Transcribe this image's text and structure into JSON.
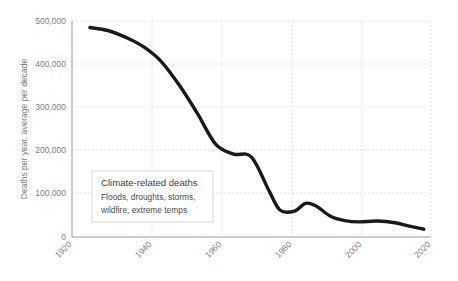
{
  "chart_data": {
    "type": "line",
    "title": "",
    "xlabel": "",
    "ylabel": "Deaths per year, average per decade",
    "xlim": [
      1920,
      2020
    ],
    "ylim": [
      0,
      500000
    ],
    "grid": true,
    "legend_position": "none",
    "x_ticks": [
      "1920",
      "1940",
      "1960",
      "1980",
      "2000",
      "2020"
    ],
    "x_tick_values": [
      1920,
      1940,
      1960,
      1980,
      2000,
      2020
    ],
    "y_ticks": [
      "0",
      "100,000",
      "200,000",
      "300,000",
      "400,000",
      "500,000"
    ],
    "y_tick_values": [
      0,
      100000,
      200000,
      300000,
      400000,
      500000
    ],
    "series": [
      {
        "name": "Climate-related deaths",
        "color": "#1a1a1a",
        "x": [
          1925,
          1930,
          1935,
          1940,
          1945,
          1950,
          1955,
          1960,
          1965,
          1970,
          1975,
          1978,
          1982,
          1985,
          1988,
          1992,
          1996,
          2000,
          2005,
          2010,
          2014,
          2018
        ],
        "values": [
          485000,
          478000,
          462000,
          440000,
          405000,
          350000,
          285000,
          215000,
          192000,
          185000,
          105000,
          62000,
          60000,
          78000,
          72000,
          48000,
          38000,
          35000,
          37000,
          33000,
          25000,
          18000
        ]
      }
    ],
    "annotations": [
      {
        "name": "climate-related-deaths-callout",
        "title": "Climate-related deaths",
        "lines": [
          "Floods, droughts, storms,",
          "wildfire, extreme temps"
        ]
      }
    ]
  }
}
